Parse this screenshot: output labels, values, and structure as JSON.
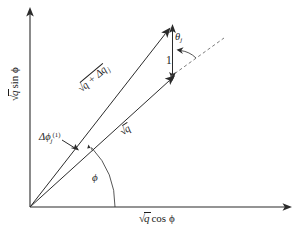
{
  "figure": {
    "name": "sqrt-q-vector-diagram",
    "background_color": "#ffffff",
    "stroke_color": "#2b2b2b",
    "dash_color": "#6d6d6d",
    "width": 308,
    "height": 237
  },
  "axes": {
    "x": {
      "label_radical": "√",
      "label_radicand": "q",
      "label_rest": "cos ϕ",
      "origin": [
        30,
        207
      ],
      "end": [
        292,
        207
      ]
    },
    "y": {
      "label_radical": "√",
      "label_radicand": "q",
      "label_rest": "sin ϕ",
      "origin": [
        30,
        207
      ],
      "end": [
        30,
        9
      ]
    }
  },
  "vectors": [
    {
      "name": "sqrt-q-vector",
      "label_radical": "√",
      "label_radicand": "q",
      "label_rest": "",
      "from": [
        30,
        207
      ],
      "to": [
        172,
        78
      ]
    },
    {
      "name": "sqrt-q-plus-dq-vector",
      "label_radical": "√",
      "label_radicand": "q + Δq",
      "label_sub": "j",
      "label_rest": "",
      "from": [
        30,
        207
      ],
      "to": [
        168,
        30
      ]
    }
  ],
  "annotations": {
    "delta_phi": {
      "symbol": "Δϕ",
      "subscript": "j",
      "superscript": "(1)"
    },
    "theta": {
      "symbol": "θ",
      "subscript": "j"
    },
    "unit_segment": {
      "label": "1"
    },
    "phi_angle": {
      "symbol": "ϕ"
    },
    "dashed_reference_line": {
      "from": [
        172,
        78
      ],
      "to": [
        219,
        41
      ]
    }
  }
}
